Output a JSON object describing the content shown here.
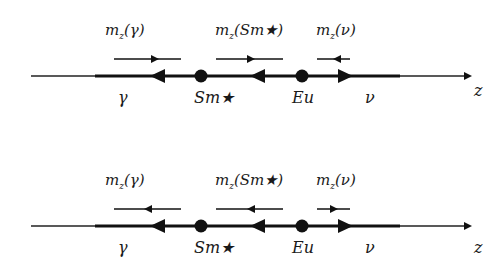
{
  "panels": [
    {
      "id": "top",
      "moment_labels": {
        "gamma": "mₓ(γ)",
        "sm": "mₓ(Sm★)",
        "nu": "mₓ(ν)"
      },
      "moment_directions": {
        "gamma": "right",
        "sm": "right",
        "nu": "left"
      },
      "axis_arrows": [
        "left",
        "left",
        "right"
      ],
      "point_labels": {
        "gamma": "γ",
        "sm": "Sm★",
        "eu": "Eu",
        "nu": "ν"
      },
      "axis_label": "z"
    },
    {
      "id": "bottom",
      "moment_labels": {
        "gamma": "mₓ(γ)",
        "sm": "mₓ(Sm★)",
        "nu": "mₓ(ν)"
      },
      "moment_directions": {
        "gamma": "left",
        "sm": "left",
        "nu": "right"
      },
      "axis_arrows": [
        "left",
        "left",
        "right"
      ],
      "point_labels": {
        "gamma": "γ",
        "sm": "Sm★",
        "eu": "Eu",
        "nu": "ν"
      },
      "axis_label": "z"
    }
  ],
  "colors": {
    "ink": "#111111",
    "background": "#ffffff"
  }
}
